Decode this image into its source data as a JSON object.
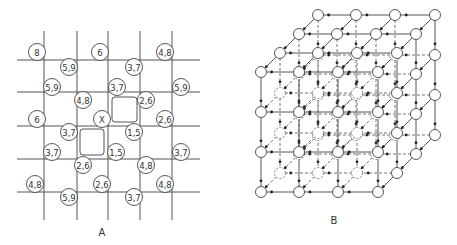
{
  "panel_a": {
    "label": "A",
    "grid": {
      "vertical_x": [
        44,
        77,
        108,
        140,
        172
      ],
      "horizontal_y": [
        60,
        92,
        126,
        159,
        192
      ],
      "x_range": [
        17,
        200
      ],
      "y_range": [
        31,
        220
      ]
    },
    "nodes": [
      {
        "text": "8",
        "x": 37,
        "y": 52
      },
      {
        "text": "6",
        "x": 100,
        "y": 52
      },
      {
        "text": "4,8",
        "x": 165,
        "y": 52
      },
      {
        "text": "5,9",
        "x": 69,
        "y": 67
      },
      {
        "text": "3,7",
        "x": 134,
        "y": 67
      },
      {
        "text": "5,9",
        "x": 52,
        "y": 87
      },
      {
        "text": "3,7",
        "x": 117,
        "y": 87
      },
      {
        "text": "5,9",
        "x": 181,
        "y": 87
      },
      {
        "text": "4,8",
        "x": 83,
        "y": 100
      },
      {
        "text": "2,6",
        "x": 146,
        "y": 100
      },
      {
        "text": "6",
        "x": 37,
        "y": 119
      },
      {
        "text": "X",
        "x": 102,
        "y": 119
      },
      {
        "text": "2,6",
        "x": 165,
        "y": 119
      },
      {
        "text": "3,7",
        "x": 69,
        "y": 132
      },
      {
        "text": "1,5",
        "x": 134,
        "y": 132
      },
      {
        "text": "3,7",
        "x": 52,
        "y": 152
      },
      {
        "text": "1,5",
        "x": 116,
        "y": 152
      },
      {
        "text": "3,7",
        "x": 181,
        "y": 152
      },
      {
        "text": "2,6",
        "x": 83,
        "y": 165
      },
      {
        "text": "4,8",
        "x": 146,
        "y": 165
      },
      {
        "text": "4,8",
        "x": 35,
        "y": 184
      },
      {
        "text": "2,6",
        "x": 102,
        "y": 184
      },
      {
        "text": "4,8",
        "x": 165,
        "y": 184
      },
      {
        "text": "5,9",
        "x": 69,
        "y": 197
      },
      {
        "text": "3,7",
        "x": 134,
        "y": 197
      }
    ],
    "loops": [
      {
        "x": 112,
        "y": 97,
        "w": 25,
        "h": 25
      },
      {
        "x": 80,
        "y": 129,
        "w": 24,
        "h": 26
      }
    ]
  },
  "panel_b": {
    "label": "B",
    "description": "3D cubic lattice of 4x4x4 nodes with directed edges",
    "front_x": [
      261,
      299,
      338,
      378
    ],
    "front_y": [
      72,
      112,
      152,
      192
    ],
    "depth_dx": 19,
    "depth_dy": -19,
    "layers": 4
  },
  "labels": {
    "a": "A",
    "b": "B"
  }
}
